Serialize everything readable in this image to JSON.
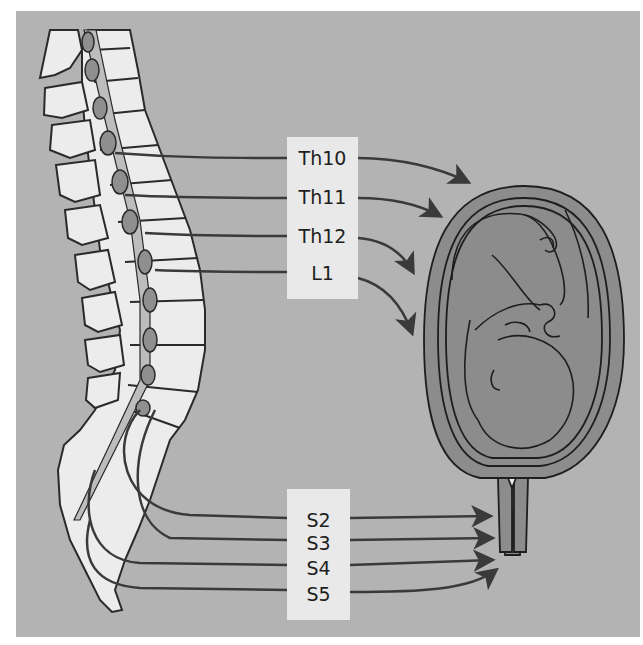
{
  "figure": {
    "colors": {
      "background": "#b3b3b3",
      "label_box": "#e9e9e9",
      "bone": "#ececec",
      "outline": "#2a2a2a",
      "uterus": "#8c8c8c",
      "nerve": "#3a3a3a",
      "spinal_cord": "#8f8f8f"
    }
  },
  "upper_labels": {
    "items": [
      {
        "text": "Th10",
        "target": "uterus-fundus"
      },
      {
        "text": "Th11",
        "target": "uterus-fundus"
      },
      {
        "text": "Th12",
        "target": "uterus-body"
      },
      {
        "text": "L1",
        "target": "uterus-body"
      }
    ]
  },
  "lower_labels": {
    "items": [
      {
        "text": "S2",
        "target": "cervix-vagina"
      },
      {
        "text": "S3",
        "target": "cervix-vagina"
      },
      {
        "text": "S4",
        "target": "cervix-vagina"
      },
      {
        "text": "S5",
        "target": "cervix-vagina"
      }
    ]
  },
  "illustrations": {
    "spine": "spine-illustration",
    "uterus": "pregnant-uterus-illustration"
  }
}
